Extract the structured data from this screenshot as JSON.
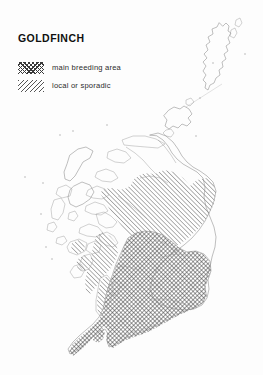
{
  "page": {
    "title": "GOLDFINCH",
    "background_color": "#fdfdfd",
    "width": 263,
    "height": 375
  },
  "legend": {
    "items": [
      {
        "id": "main-breeding-area",
        "label": "main breeding area",
        "pattern": "cross-hatch",
        "color": "#3a3a3a"
      },
      {
        "id": "local-or-sporadic",
        "label": "local or sporadic",
        "pattern": "diagonal-hatch",
        "color": "#565656"
      }
    ]
  },
  "map": {
    "region": "Scotland",
    "coast_color": "#8a8a8a",
    "inset_line_color": "#c9c9c9",
    "areas": [
      {
        "id": "southern-uplands-central-belt",
        "fill": "cross-hatch",
        "legend": "main breeding area"
      },
      {
        "id": "northeast-and-central-highlands",
        "fill": "diagonal-hatch",
        "legend": "local or sporadic"
      },
      {
        "id": "moray-firth-patch",
        "fill": "diagonal-hatch",
        "legend": "local or sporadic"
      },
      {
        "id": "argyll-islands-patches",
        "fill": "diagonal-hatch",
        "legend": "local or sporadic"
      }
    ],
    "unshaded": [
      "Outer Hebrides",
      "Northwest Highlands",
      "Caithness",
      "Orkney",
      "Shetland"
    ]
  }
}
